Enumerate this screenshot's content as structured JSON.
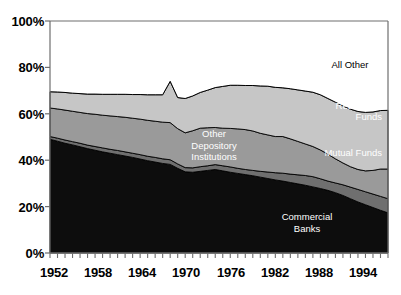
{
  "chart_data": {
    "type": "area",
    "stacked": true,
    "title": "",
    "xlabel": "",
    "ylabel": "",
    "ylim": [
      0,
      100
    ],
    "xlim": [
      1952,
      1997
    ],
    "grid": false,
    "legend": "inline-annotations",
    "y_ticks": [
      "0%",
      "20%",
      "40%",
      "60%",
      "80%",
      "100%"
    ],
    "y_tick_values": [
      0,
      20,
      40,
      60,
      80,
      100
    ],
    "x_ticks": [
      "1952",
      "1958",
      "1964",
      "1970",
      "1976",
      "1982",
      "1988",
      "1994"
    ],
    "x_tick_values": [
      1952,
      1958,
      1964,
      1970,
      1976,
      1982,
      1988,
      1994
    ],
    "x_minor_tick_interval": 1,
    "x": [
      1952,
      1953,
      1954,
      1955,
      1956,
      1957,
      1958,
      1959,
      1960,
      1961,
      1962,
      1963,
      1964,
      1965,
      1966,
      1967,
      1968,
      1969,
      1970,
      1971,
      1972,
      1973,
      1974,
      1975,
      1976,
      1977,
      1978,
      1979,
      1980,
      1981,
      1982,
      1983,
      1984,
      1985,
      1986,
      1987,
      1988,
      1989,
      1990,
      1991,
      1992,
      1993,
      1994,
      1995,
      1996,
      1997
    ],
    "series": [
      {
        "name": "Commercial Banks",
        "color": "#0d0d0d",
        "label_color": "#ffffff",
        "values": [
          49.0,
          48.2,
          47.3,
          46.6,
          45.8,
          45.0,
          44.3,
          43.6,
          43.0,
          42.4,
          41.8,
          41.2,
          40.5,
          39.8,
          39.2,
          38.6,
          38.2,
          36.5,
          35.0,
          34.8,
          35.2,
          35.6,
          36.0,
          35.4,
          34.8,
          34.3,
          33.8,
          33.3,
          32.7,
          32.1,
          31.5,
          31.0,
          30.4,
          29.8,
          29.2,
          28.5,
          27.8,
          27.0,
          26.0,
          24.8,
          23.4,
          22.0,
          20.8,
          19.6,
          18.4,
          17.3
        ]
      },
      {
        "name": "Mutual Funds",
        "color": "#6f6f6f",
        "label_color": "#ffffff",
        "values": [
          1.2,
          1.3,
          1.4,
          1.4,
          1.5,
          1.5,
          1.6,
          1.7,
          1.7,
          1.8,
          1.8,
          1.8,
          1.9,
          1.9,
          2.0,
          2.0,
          2.0,
          1.9,
          1.8,
          1.9,
          2.0,
          2.0,
          2.1,
          2.2,
          2.3,
          2.2,
          2.2,
          2.3,
          2.5,
          2.8,
          3.1,
          3.4,
          3.6,
          3.9,
          4.2,
          4.4,
          4.2,
          4.0,
          4.2,
          4.6,
          5.0,
          5.4,
          5.6,
          5.8,
          6.0,
          6.1
        ]
      },
      {
        "name": "Other Depository Institutions",
        "color": "#9a9a9a",
        "label_color": "#ffffff",
        "values": [
          12.3,
          12.6,
          12.9,
          13.1,
          13.3,
          13.6,
          13.9,
          14.1,
          14.4,
          14.6,
          14.9,
          15.1,
          15.3,
          15.5,
          15.6,
          15.8,
          16.0,
          15.2,
          15.0,
          16.0,
          16.6,
          16.4,
          16.0,
          16.2,
          16.6,
          17.0,
          17.2,
          17.0,
          16.4,
          16.0,
          15.6,
          15.8,
          15.2,
          14.4,
          13.6,
          13.0,
          12.4,
          11.6,
          10.4,
          9.4,
          8.8,
          8.6,
          9.0,
          10.2,
          11.8,
          12.8
        ]
      },
      {
        "name": "Pension & Retirement Funds",
        "color": "#c6c6c6",
        "label_color": "#ffffff",
        "values": [
          7.0,
          7.3,
          7.6,
          7.8,
          8.1,
          8.4,
          8.7,
          9.0,
          9.3,
          9.6,
          9.9,
          10.2,
          10.6,
          11.0,
          11.4,
          11.8,
          17.8,
          13.4,
          14.8,
          15.0,
          15.4,
          16.2,
          17.2,
          18.0,
          18.6,
          18.8,
          19.0,
          19.6,
          20.4,
          21.0,
          21.2,
          21.0,
          21.6,
          22.2,
          22.8,
          23.4,
          23.8,
          24.0,
          24.4,
          24.6,
          24.8,
          25.0,
          25.2,
          25.2,
          25.2,
          25.3
        ]
      },
      {
        "name": "All Other",
        "color": "#ffffff",
        "label_color": "#000000",
        "values": [
          30.5,
          30.6,
          30.8,
          31.1,
          31.3,
          31.5,
          31.5,
          31.6,
          31.6,
          31.6,
          31.6,
          31.7,
          31.7,
          31.8,
          31.8,
          31.8,
          26.0,
          33.0,
          33.4,
          32.3,
          30.8,
          29.8,
          28.7,
          28.2,
          27.7,
          27.7,
          27.8,
          27.8,
          28.0,
          28.1,
          28.6,
          28.8,
          29.2,
          29.7,
          30.2,
          30.7,
          31.8,
          33.4,
          35.0,
          36.6,
          38.0,
          39.0,
          39.4,
          39.2,
          38.6,
          38.5
        ]
      }
    ],
    "annotations": [
      {
        "name": "all-other-label",
        "text": "All Other",
        "x": 1989.5,
        "y": 80.0
      },
      {
        "name": "pension-label",
        "text": "Pension &\nRetirement\nFunds",
        "x": 1992.5,
        "y": 48.0
      },
      {
        "name": "mutual-funds-label",
        "text": "Mutual Funds",
        "x": 1993.0,
        "y": 30.0
      },
      {
        "name": "other-depository-label",
        "text": "Other\nDepository\nInstitutions",
        "x": 1976.0,
        "y": 42.0
      },
      {
        "name": "commercial-banks-label",
        "text": "Commercial\nBanks",
        "x": 1987.0,
        "y": 14.0
      }
    ],
    "axis_color": "#6e6e6e",
    "outline_color": "#000000"
  },
  "labels": {
    "y": [
      "100%",
      "80%",
      "60%",
      "40%",
      "20%",
      "0%"
    ],
    "x": [
      "1952",
      "1958",
      "1964",
      "1970",
      "1976",
      "1982",
      "1988",
      "1994"
    ],
    "all_other": "All Other",
    "pension_line1": "Pension &",
    "pension_line2": "Retirement",
    "pension_line3": "Funds",
    "mutual_funds": "Mutual Funds",
    "other_dep_line1": "Other",
    "other_dep_line2": "Depository",
    "other_dep_line3": "Institutions",
    "commercial_line1": "Commercial",
    "commercial_line2": "Banks"
  }
}
